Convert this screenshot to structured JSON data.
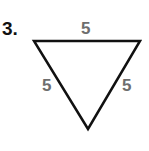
{
  "problem": {
    "number": "3."
  },
  "triangle": {
    "type": "equilateral",
    "orientation": "inverted",
    "vertices": {
      "top_left": [
        34,
        41
      ],
      "top_right": [
        140,
        41
      ],
      "bottom": [
        88,
        129
      ]
    },
    "stroke_color": "#111111",
    "label_color": "#6e6e6e",
    "sides": {
      "top": "5",
      "left": "5",
      "right": "5"
    }
  }
}
